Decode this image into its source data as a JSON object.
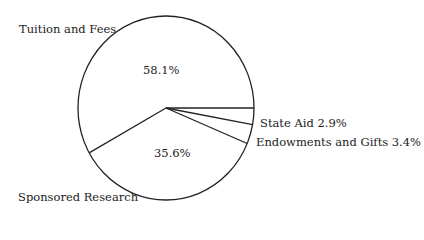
{
  "chart_data": {
    "type": "pie",
    "title": "",
    "categories": [
      "Tuition and Fees",
      "State Aid",
      "Endowments and Gifts",
      "Sponsored Research"
    ],
    "values": [
      58.1,
      2.9,
      3.4,
      35.6
    ],
    "unit": "%",
    "labels": {
      "tuition": "Tuition and Fees",
      "tuition_pct": "58.1%",
      "state": "State Aid 2.9%",
      "endow": "Endowments and Gifts 3.4%",
      "sponsored": "Sponsored Research",
      "sponsored_pct": "35.6%"
    },
    "colors": {
      "fill": "#ffffff",
      "stroke": "#222222"
    }
  }
}
